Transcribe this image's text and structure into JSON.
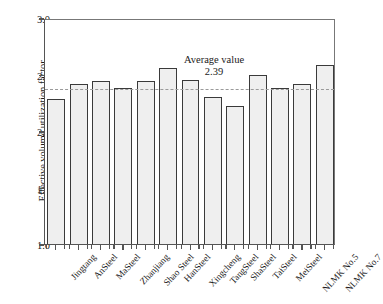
{
  "chart_data": {
    "type": "bar",
    "title": "",
    "xlabel": "",
    "ylabel": "Effective volume utilization factor",
    "ylim": [
      1.0,
      3.0
    ],
    "yticks": [
      "1.0",
      "1.5",
      "2.0",
      "2.5",
      "3.0"
    ],
    "ytick_values": [
      1.0,
      1.5,
      2.0,
      2.5,
      3.0
    ],
    "grid": false,
    "legend": "none",
    "categories": [
      "Jingtang",
      "AnSteel",
      "MaSteel",
      "Zhanjiang",
      "Shao Steel",
      "HanSteel",
      "Xingcheng",
      "TangSteel",
      "ShaSteel",
      "TaiSteel",
      "MeiSteel",
      "NLMK No.5",
      "NLMK No.7"
    ],
    "values": [
      2.28,
      2.42,
      2.44,
      2.38,
      2.44,
      2.56,
      2.45,
      2.3,
      2.22,
      2.5,
      2.38,
      2.42,
      2.58
    ],
    "annotations": [
      {
        "name": "average-value",
        "label": "Average value",
        "value": "2.39",
        "numeric": 2.39,
        "line_style": "dashed",
        "line_color": "#9a9a9a"
      }
    ],
    "bar_fill": "#efefef",
    "bar_edge": "#3a3a3a"
  }
}
